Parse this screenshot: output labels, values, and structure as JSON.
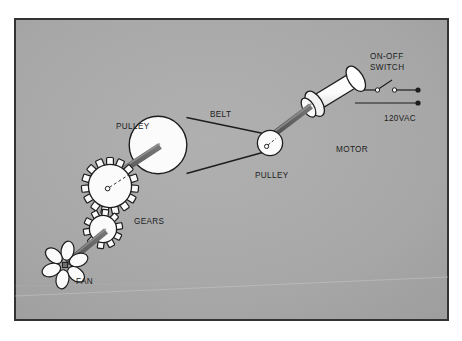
{
  "figure": {
    "kind": "technical-line-diagram",
    "background_color": "#a8a8a8",
    "frame_color": "#333333",
    "part_fill_color": "#fbfbfb",
    "shaft_color": "#6e6e6e",
    "line_color": "#1d1d1d"
  },
  "labels": {
    "switch": "ON-OFF\nSWITCH",
    "switch_line1": "ON-OFF",
    "switch_line2": "SWITCH",
    "supply": "120VAC",
    "motor": "MOTOR",
    "pulley_small": "PULLEY",
    "belt": "BELT",
    "pulley_large": "PULLEY",
    "gears": "GEARS",
    "fan": "FAN"
  },
  "components": [
    {
      "name": "power-supply",
      "label": "120VAC",
      "type": "terminals"
    },
    {
      "name": "on-off-switch",
      "label": "ON-OFF SWITCH",
      "type": "knife-switch"
    },
    {
      "name": "motor",
      "label": "MOTOR",
      "type": "cylinder"
    },
    {
      "name": "pulley-small",
      "label": "PULLEY",
      "type": "circle"
    },
    {
      "name": "belt",
      "label": "BELT",
      "type": "band"
    },
    {
      "name": "pulley-large",
      "label": "PULLEY",
      "type": "circle"
    },
    {
      "name": "gears",
      "label": "GEARS",
      "type": "toothed-wheels"
    },
    {
      "name": "fan",
      "label": "FAN",
      "type": "bladed-rotor"
    }
  ]
}
